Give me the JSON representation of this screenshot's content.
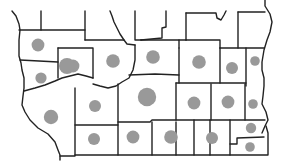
{
  "map": {
    "type": "proportional-symbol-map",
    "colors": {
      "symbol": "#999999",
      "border": "#222222",
      "background": "#ffffff"
    },
    "regions": [
      {
        "id": "r1",
        "relative_value": 0.8
      },
      {
        "id": "r2",
        "relative_value": 0.7
      },
      {
        "id": "r3",
        "relative_value": 0.8
      },
      {
        "id": "r4",
        "relative_value": 0.85
      },
      {
        "id": "r5",
        "relative_value": 0.85
      },
      {
        "id": "r6",
        "relative_value": 0.85
      },
      {
        "id": "r7",
        "relative_value": 1.0
      },
      {
        "id": "r8",
        "relative_value": 0.75
      },
      {
        "id": "r9",
        "relative_value": 0.6
      },
      {
        "id": "r10",
        "relative_value": 0.9
      },
      {
        "id": "r11",
        "relative_value": 0.75
      },
      {
        "id": "r12",
        "relative_value": 1.15
      },
      {
        "id": "r13",
        "relative_value": 0.8
      },
      {
        "id": "r14",
        "relative_value": 0.8
      },
      {
        "id": "r15",
        "relative_value": 0.6
      },
      {
        "id": "r16",
        "relative_value": 0.75
      },
      {
        "id": "r17",
        "relative_value": 0.8
      },
      {
        "id": "r18",
        "relative_value": 0.85
      },
      {
        "id": "r19",
        "relative_value": 0.75
      },
      {
        "id": "r20",
        "relative_value": 0.65
      },
      {
        "id": "r21",
        "relative_value": 0.6
      }
    ]
  }
}
